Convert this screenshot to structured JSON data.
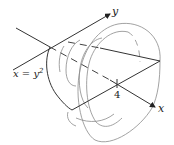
{
  "figure": {
    "labels": {
      "y_axis": "y",
      "x_axis": "x",
      "curve": "x = y",
      "curve_exponent": "2",
      "tick_value": "4"
    },
    "colors": {
      "axis": "#333333",
      "cross_section": "#8a8a8a",
      "background": "#ffffff"
    }
  }
}
